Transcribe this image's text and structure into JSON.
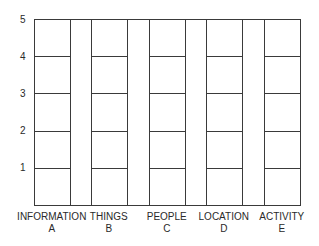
{
  "chart_data": {
    "type": "table",
    "title": "",
    "xlabel": "",
    "ylabel": "",
    "ylim": [
      0,
      5
    ],
    "yticks": [
      "1",
      "2",
      "3",
      "4",
      "5"
    ],
    "grid": false,
    "categories": [
      {
        "name": "INFORMATION",
        "letter": "A",
        "levels": 5
      },
      {
        "name": "THINGS",
        "letter": "B",
        "levels": 5
      },
      {
        "name": "PEOPLE",
        "letter": "C",
        "levels": 5
      },
      {
        "name": "LOCATION",
        "letter": "D",
        "levels": 5
      },
      {
        "name": "ACTIVITY",
        "letter": "E",
        "levels": 5
      }
    ],
    "colors": {
      "line": "#3a3a3a",
      "background": "#ffffff",
      "text": "#2a2a2a"
    }
  }
}
